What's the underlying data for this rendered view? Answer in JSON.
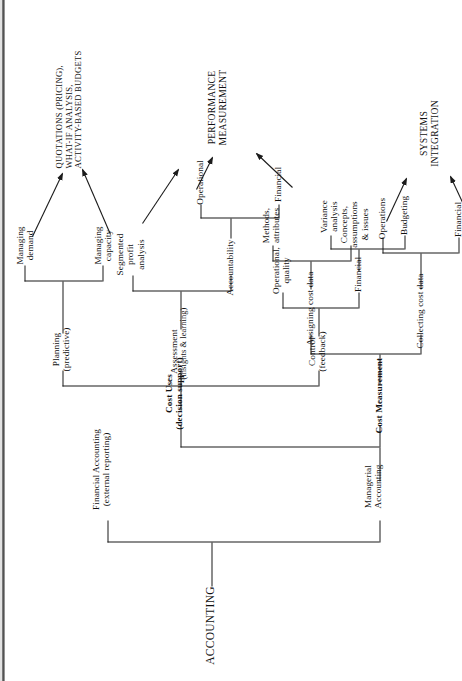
{
  "diagram": {
    "title": "ACCOUNTING",
    "type": "hierarchical-tree",
    "orientation": "rotated-90-ccw",
    "root": "ACCOUNTING",
    "nodes": {
      "root": "ACCOUNTING",
      "financial_accounting": "Financial Accounting",
      "financial_accounting_sub": "(external reporting)",
      "managerial_accounting": "Managerial",
      "managerial_accounting_sub": "Accounting",
      "cost_measurement": "Cost Measurement",
      "cost_uses": "Cost Uses",
      "cost_uses_sub": "(decision support)",
      "collecting_cost_data": "Collecting cost data",
      "assigning_cost_data": "Assigning cost data",
      "collecting_financial": "Financial",
      "collecting_operations": "Operations",
      "concepts": "Concepts,",
      "concepts_l2": "assumptions",
      "concepts_l3": "& issues",
      "methods": "Methods,",
      "methods_l2": "attributes",
      "control": "Control",
      "control_sub": "(feedback)",
      "assessment": "Assessment",
      "assessment_sub": "(insights & learning)",
      "planning": "Planning",
      "planning_sub": "(predictive)",
      "control_financial": "Financial",
      "control_operational": "Operational,",
      "control_operational_l2": "quality",
      "variance_analysis": "Variance",
      "variance_analysis_l2": "analysis",
      "budgeting": "Budgeting",
      "segmented": "Segmented",
      "segmented_l2": "profit",
      "segmented_l3": "analysis",
      "accountability": "Accountability",
      "accountability_operational": "Operational",
      "accountability_financial": "Financial",
      "managing_demand": "Managing",
      "managing_demand_l2": "demand",
      "managing_capacity": "Managing",
      "managing_capacity_l2": "capacity",
      "systems_integration": "SYSTEMS",
      "systems_integration_l2": "INTEGRATION",
      "performance_measurement": "PERFORMANCE",
      "performance_measurement_l2": "MEASUREMENT",
      "quotations": "QUOTATIONS (PRICING),",
      "quotations_l2": "WHAT-IF ANALYSIS,",
      "quotations_l3": "ACTIVITY-BASED BUDGETS"
    },
    "outcomes": [
      "SYSTEMS INTEGRATION",
      "PERFORMANCE MEASUREMENT",
      "QUOTATIONS (PRICING), WHAT-IF ANALYSIS, ACTIVITY-BASED BUDGETS"
    ],
    "colors": {
      "line": "#1b1b1b",
      "text": "#111111",
      "background": "#ffffff"
    }
  }
}
